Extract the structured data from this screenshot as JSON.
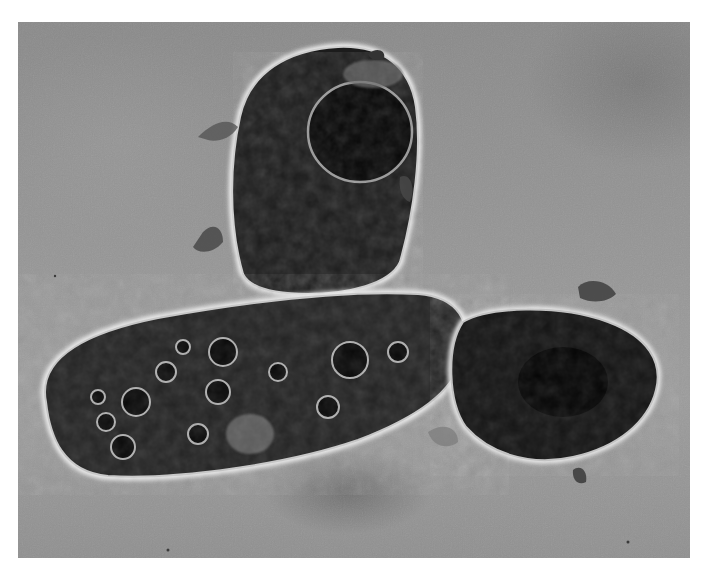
{
  "image": {
    "kind": "micrograph",
    "description": "Phase-contrast micrograph of three protozoan cells (ciliates) on a grey background",
    "tones": {
      "background": "#929292",
      "cell_interior": "#1a1a1a",
      "cell_halo": "#e8e8e8",
      "vacuole_rim": "#bdbdbd"
    },
    "subjects": [
      {
        "name": "top-cell",
        "shape": "rounded rectangular",
        "feature": "large dark circular inclusion"
      },
      {
        "name": "left-elongated-cell",
        "shape": "elongated ellipse",
        "feature": "many food vacuoles"
      },
      {
        "name": "right-cell",
        "shape": "oval",
        "feature": "dark granular cytoplasm"
      }
    ]
  }
}
